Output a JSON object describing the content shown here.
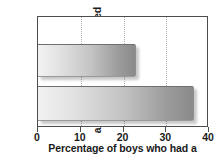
{
  "chart_data": {
    "type": "bar",
    "orientation": "horizontal",
    "title": "",
    "xlabel": "Percentage of boys who had a",
    "ylabel_lines": [
      "After cooperative",
      "activities were introduced"
    ],
    "ylabel": "After cooperative activities were introduced",
    "categories": [
      "",
      ""
    ],
    "values": [
      23,
      36.5
    ],
    "series": [
      {
        "name": "",
        "values": [
          23,
          36.5
        ]
      }
    ],
    "xlim": [
      0,
      40
    ],
    "xticks": [
      0,
      10,
      20,
      30,
      40
    ],
    "xticklabels": [
      "0",
      "10",
      "20",
      "30",
      "40"
    ],
    "yticks": [],
    "yticklabels": [],
    "grid": "vertical-dotted",
    "legend": "none",
    "bar_gradient_start": "#f2f2f2",
    "bar_gradient_end": "#8a8a8a",
    "frame_color": "#4d4d4d",
    "gridline_color": "#b0b0b0",
    "text_color": "#1a1a1a",
    "background": "#ffffff"
  }
}
